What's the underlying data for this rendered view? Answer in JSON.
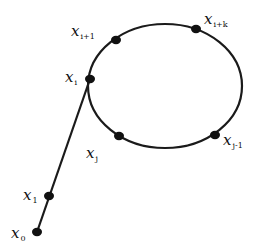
{
  "diagram": {
    "type": "rho-shaped sequence path (tail leading into a cycle)",
    "colors": {
      "line": "#1a1a1a",
      "node": "#111111",
      "background": "#ffffff"
    },
    "cycle": {
      "cx": 165,
      "cy": 86,
      "rx": 77,
      "ry": 62
    },
    "tail": {
      "from": "x0",
      "to": "xi"
    },
    "nodes": [
      {
        "id": "x0",
        "x": 37,
        "y": 232,
        "label_base": "x",
        "label_sub": "0",
        "lx": 11,
        "ly": 238
      },
      {
        "id": "x1",
        "x": 49,
        "y": 196,
        "label_base": "x",
        "label_sub": "1",
        "lx": 23,
        "ly": 200
      },
      {
        "id": "xi",
        "x": 90,
        "y": 79,
        "label_base": "x",
        "label_sub": "i",
        "lx": 65,
        "ly": 82
      },
      {
        "id": "xi1",
        "x": 116,
        "y": 40,
        "label_base": "x",
        "label_sub": "i+1",
        "lx": 71,
        "ly": 36
      },
      {
        "id": "xik",
        "x": 196,
        "y": 29,
        "label_base": "x",
        "label_sub": "i+k",
        "lx": 204,
        "ly": 24
      },
      {
        "id": "xj1",
        "x": 215,
        "y": 135,
        "label_base": "x",
        "label_sub": "j-1",
        "lx": 223,
        "ly": 145
      },
      {
        "id": "xj",
        "x": 119,
        "y": 136,
        "label_base": "x",
        "label_sub": "j",
        "lx": 86,
        "ly": 158
      }
    ]
  }
}
